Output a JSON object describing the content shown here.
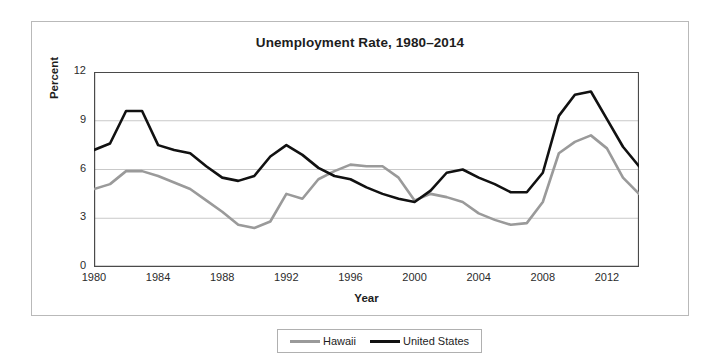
{
  "chart_data": {
    "type": "line",
    "title": "Unemployment Rate, 1980–2014",
    "xlabel": "Year",
    "ylabel": "Percent",
    "xlim": [
      1980,
      2014
    ],
    "ylim": [
      0,
      12
    ],
    "yticks": [
      0,
      3,
      6,
      9,
      12
    ],
    "xticks": [
      1980,
      1984,
      1988,
      1992,
      1996,
      2000,
      2004,
      2008,
      2012
    ],
    "x_minor_tick_interval": 2,
    "grid": "horizontal",
    "legend_position": "bottom-center",
    "x": [
      1980,
      1981,
      1982,
      1983,
      1984,
      1985,
      1986,
      1987,
      1988,
      1989,
      1990,
      1991,
      1992,
      1993,
      1994,
      1995,
      1996,
      1997,
      1998,
      1999,
      2000,
      2001,
      2002,
      2003,
      2004,
      2005,
      2006,
      2007,
      2008,
      2009,
      2010,
      2011,
      2012,
      2013,
      2014
    ],
    "series": [
      {
        "name": "Hawaii",
        "color": "#9a9a9a",
        "values": [
          4.8,
          5.1,
          5.9,
          5.9,
          5.6,
          5.2,
          4.8,
          4.1,
          3.4,
          2.6,
          2.4,
          2.8,
          4.5,
          4.2,
          5.4,
          5.9,
          6.3,
          6.2,
          6.2,
          5.5,
          4.1,
          4.5,
          4.3,
          4.0,
          3.3,
          2.9,
          2.6,
          2.7,
          4.0,
          7.0,
          7.7,
          8.1,
          7.3,
          5.5,
          4.5
        ]
      },
      {
        "name": "United States",
        "color": "#111111",
        "values": [
          7.2,
          7.6,
          9.6,
          9.6,
          7.5,
          7.2,
          7.0,
          6.2,
          5.5,
          5.3,
          5.6,
          6.8,
          7.5,
          6.9,
          6.1,
          5.6,
          5.4,
          4.9,
          4.5,
          4.2,
          4.0,
          4.7,
          5.8,
          6.0,
          5.5,
          5.1,
          4.6,
          4.6,
          5.8,
          9.3,
          10.6,
          10.8,
          9.1,
          7.4,
          6.2
        ]
      }
    ]
  },
  "legend": {
    "items": [
      {
        "label": "Hawaii",
        "color": "#9a9a9a"
      },
      {
        "label": "United States",
        "color": "#111111"
      }
    ]
  }
}
